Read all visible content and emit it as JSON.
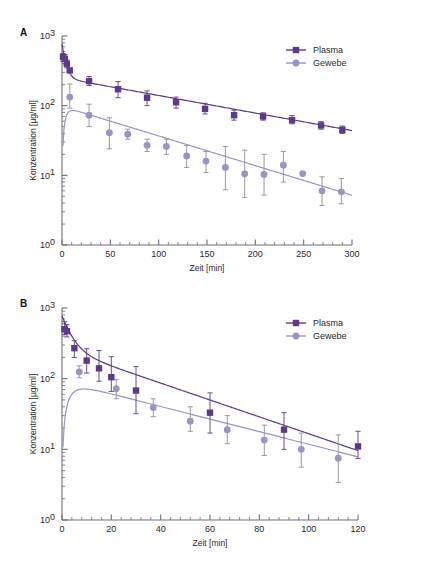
{
  "figure": {
    "background": "#ffffff",
    "panels": [
      "A",
      "B"
    ]
  },
  "colors": {
    "plasma": "#5B3A8E",
    "gewebe": "#9B93C6",
    "axis": "#6f6f78",
    "text": "#2b2b2b",
    "errorbar_plasma": "#5B3A8E",
    "errorbar_gewebe": "#8f8f96"
  },
  "panel_a": {
    "letter": "A",
    "legend": [
      {
        "label": "Plasma",
        "marker": "square",
        "color": "#5B3A8E"
      },
      {
        "label": "Gewebe",
        "marker": "circle",
        "color": "#9B93C6"
      }
    ],
    "xlabel": "Zeit [min]",
    "ylabel": "Konzentration [µg/ml]",
    "xticks": [
      0,
      50,
      100,
      150,
      200,
      250,
      300
    ],
    "yticks": [
      "10⁰",
      "10¹",
      "10²",
      "10³"
    ],
    "ytick_bases": [
      10,
      10,
      10,
      10
    ],
    "ytick_exponents": [
      0,
      1,
      2,
      3
    ]
  },
  "panel_b": {
    "letter": "B",
    "legend": [
      {
        "label": "Plasma",
        "marker": "square",
        "color": "#5B3A8E"
      },
      {
        "label": "Gewebe",
        "marker": "circle",
        "color": "#9B93C6"
      }
    ],
    "xlabel": "Zeit [min]",
    "ylabel": "Konzentration [µg/ml]",
    "xticks": [
      0,
      20,
      40,
      60,
      80,
      100,
      120
    ],
    "yticks": [
      "10⁰",
      "10¹",
      "10²",
      "10³"
    ],
    "ytick_exponents": [
      0,
      1,
      2,
      3
    ]
  },
  "chart_data": [
    {
      "type": "scatter",
      "panel": "A",
      "title": "",
      "xlabel": "Zeit [min]",
      "ylabel": "Konzentration [µg/ml]",
      "xlim": [
        0,
        300
      ],
      "ylim": [
        1,
        1000
      ],
      "yscale": "log",
      "grid": false,
      "legend_position": "top-right",
      "series": [
        {
          "name": "Plasma",
          "marker": "square",
          "color": "#5B3A8E",
          "x": [
            1,
            3,
            5,
            8,
            28,
            58,
            88,
            118,
            148,
            178,
            208,
            238,
            268,
            290
          ],
          "y": [
            500,
            470,
            400,
            320,
            225,
            172,
            130,
            112,
            90,
            73,
            70,
            62,
            52,
            45
          ],
          "yerr_low": [
            430,
            400,
            350,
            300,
            195,
            130,
            100,
            92,
            76,
            62,
            62,
            55,
            46,
            40
          ],
          "yerr_high": [
            560,
            540,
            450,
            345,
            262,
            222,
            163,
            133,
            108,
            86,
            79,
            72,
            59,
            51
          ]
        },
        {
          "name": "Gewebe",
          "marker": "circle",
          "color": "#9B93C6",
          "x": [
            8,
            28,
            49,
            68,
            88,
            108,
            129,
            149,
            169,
            189,
            209,
            229,
            249,
            269,
            289
          ],
          "y": [
            133,
            73,
            41,
            39,
            27,
            26,
            19,
            16,
            13,
            10.5,
            10.3,
            14,
            10.6,
            6.0,
            5.8
          ],
          "yerr_low": [
            92,
            50,
            24,
            33,
            22,
            20,
            13,
            11,
            6.2,
            4.8,
            5.2,
            8.0,
            null,
            3.7,
            3.9
          ],
          "yerr_high": [
            205,
            105,
            67,
            46,
            33,
            33,
            27,
            22,
            26,
            23,
            20,
            22,
            null,
            9.5,
            9.0
          ]
        }
      ],
      "fit_curves": [
        {
          "name": "Plasma fit",
          "color": "#5B3A8E",
          "model": "biexponential"
        },
        {
          "name": "Gewebe fit",
          "color": "#9B93C6",
          "model": "absorption-elimination"
        }
      ]
    },
    {
      "type": "scatter",
      "panel": "B",
      "title": "",
      "xlabel": "Zeit [min]",
      "ylabel": "Konzentration [µg/ml]",
      "xlim": [
        0,
        120
      ],
      "ylim": [
        1,
        1000
      ],
      "yscale": "log",
      "grid": false,
      "legend_position": "top-right",
      "series": [
        {
          "name": "Plasma",
          "marker": "square",
          "color": "#5B3A8E",
          "x": [
            1,
            2,
            5,
            10,
            15,
            20,
            30,
            60,
            90,
            120
          ],
          "y": [
            500,
            470,
            270,
            180,
            140,
            105,
            68,
            33,
            19,
            11
          ],
          "yerr_low": [
            420,
            390,
            200,
            120,
            92,
            66,
            32,
            17,
            10,
            7.4
          ],
          "yerr_high": [
            640,
            580,
            345,
            265,
            250,
            205,
            148,
            63,
            33,
            18
          ]
        },
        {
          "name": "Gewebe",
          "marker": "circle",
          "color": "#9B93C6",
          "x": [
            7,
            22,
            37,
            52,
            67,
            82,
            97,
            112
          ],
          "y": [
            125,
            72,
            39,
            25,
            19,
            13.5,
            10,
            7.5
          ],
          "yerr_low": [
            103,
            52,
            29,
            18,
            12,
            8.2,
            5.6,
            3.4
          ],
          "yerr_high": [
            152,
            97,
            52,
            40,
            30,
            22,
            17,
            16
          ]
        }
      ],
      "fit_curves": [
        {
          "name": "Plasma fit",
          "color": "#5B3A8E",
          "model": "biexponential"
        },
        {
          "name": "Gewebe fit",
          "color": "#9B93C6",
          "model": "absorption-elimination"
        }
      ]
    }
  ]
}
